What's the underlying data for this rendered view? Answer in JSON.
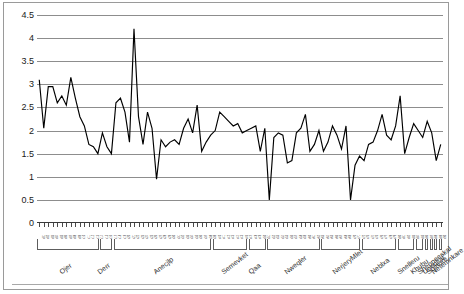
{
  "chart_data": {
    "type": "line",
    "title": "",
    "xlabel": "",
    "ylabel": "",
    "ylim": [
      0,
      4.5
    ],
    "grid": true,
    "legend": false,
    "y_ticks": [
      "4.5",
      "4",
      "3.5",
      "3",
      "2.5",
      "2",
      "1.5",
      "1",
      "0.5",
      "0"
    ],
    "y_tick_values": [
      4.5,
      4,
      3.5,
      3,
      2.5,
      2,
      1.5,
      1,
      0.5,
      0
    ],
    "series": [
      {
        "name": "series-1",
        "values": [
          3.1,
          2.05,
          2.95,
          2.95,
          2.6,
          2.75,
          2.55,
          3.15,
          2.7,
          2.3,
          2.1,
          1.7,
          1.65,
          1.5,
          1.95,
          1.65,
          1.5,
          2.6,
          2.7,
          2.4,
          1.75,
          4.2,
          2.3,
          1.7,
          2.4,
          2.05,
          0.95,
          1.8,
          1.65,
          1.75,
          1.8,
          1.7,
          2.05,
          2.25,
          1.95,
          2.55,
          1.55,
          1.75,
          1.9,
          2.0,
          2.4,
          2.3,
          2.2,
          2.1,
          2.15,
          1.95,
          2.0,
          2.05,
          2.1,
          1.55,
          2.05,
          0.5,
          1.85,
          1.95,
          1.9,
          1.3,
          1.35,
          1.95,
          2.05,
          2.35,
          1.55,
          1.7,
          2.0,
          1.55,
          1.75,
          2.1,
          1.9,
          1.6,
          2.1,
          0.5,
          1.25,
          1.45,
          1.35,
          1.7,
          1.75,
          2.0,
          2.35,
          1.9,
          1.8,
          2.1,
          2.75,
          1.5,
          1.85,
          2.15,
          2.0,
          1.85,
          2.2,
          1.95,
          1.35,
          1.7
        ]
      }
    ],
    "x_tick_labels": [
      "x01",
      "x02",
      "x03",
      "x04",
      "x05",
      "x06",
      "x07",
      "x08",
      "x09",
      "x10",
      "x11",
      "x12",
      "x13",
      "x14",
      "x15",
      "x16",
      "x17",
      "x18",
      "x19",
      "x20",
      "x21",
      "x22",
      "x23",
      "x24",
      "x25",
      "x26",
      "x27",
      "x28",
      "x29",
      "x30",
      "x31",
      "x32",
      "x33",
      "x34",
      "x35",
      "x36",
      "x37",
      "x38",
      "x39",
      "x40",
      "x41",
      "x42",
      "x43",
      "x44",
      "x45",
      "x46",
      "x47",
      "x48",
      "x49",
      "x50",
      "x51",
      "x52",
      "x53",
      "x54",
      "x55",
      "x56",
      "x57",
      "x58",
      "x59",
      "x60",
      "x61",
      "x62",
      "x63",
      "x64",
      "x65",
      "x66",
      "x67",
      "x68",
      "x69",
      "x70",
      "x71",
      "x72",
      "x73",
      "x74",
      "x75",
      "x76",
      "x77",
      "x78",
      "x79",
      "x80",
      "x81",
      "x82",
      "x83",
      "x84",
      "x85",
      "x86",
      "x87",
      "x88",
      "x89",
      "x90"
    ],
    "groups": [
      {
        "label": "Ojer",
        "start": 0,
        "end": 13
      },
      {
        "label": "Derr",
        "start": 14,
        "end": 16
      },
      {
        "label": "Anecjlp",
        "start": 17,
        "end": 38
      },
      {
        "label": "Semevket",
        "start": 39,
        "end": 46
      },
      {
        "label": "Qaa",
        "start": 47,
        "end": 50
      },
      {
        "label": "Nweqler",
        "start": 51,
        "end": 62
      },
      {
        "label": "NerjeryMlet",
        "start": 63,
        "end": 71
      },
      {
        "label": "Neblxa",
        "start": 72,
        "end": 79
      },
      {
        "label": "Snelleru",
        "start": 80,
        "end": 83
      },
      {
        "label": "Khubu",
        "start": 84,
        "end": 85
      },
      {
        "label": "Sheppeeskal",
        "start": 86,
        "end": 86
      },
      {
        "label": "Uoeqltal",
        "start": 87,
        "end": 87
      },
      {
        "label": "Sqinure",
        "start": 88,
        "end": 88
      },
      {
        "label": "Netemnkare",
        "start": 89,
        "end": 89
      }
    ],
    "colors": {
      "line": "#000000",
      "grid": "#8d8d8d",
      "axis": "#3a3a3a",
      "border": "#9a9a9a",
      "background": "#ffffff",
      "text": "#1a1a1a"
    }
  }
}
